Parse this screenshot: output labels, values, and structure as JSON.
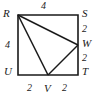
{
  "figure": {
    "type": "geometry-diagram",
    "stroke_color": "#1a1a1a",
    "background_color": "#ffffff",
    "vertices": [
      {
        "key": "R",
        "label": "R",
        "x": 18,
        "y": 15,
        "role": "square-corner-top-left"
      },
      {
        "key": "S",
        "label": "S",
        "x": 78,
        "y": 15,
        "role": "square-corner-top-right"
      },
      {
        "key": "T",
        "label": "T",
        "x": 78,
        "y": 75,
        "role": "square-corner-bottom-right"
      },
      {
        "key": "U",
        "label": "U",
        "x": 18,
        "y": 75,
        "role": "square-corner-bottom-left"
      },
      {
        "key": "W",
        "label": "W",
        "x": 78,
        "y": 45,
        "role": "midpoint-right-side"
      },
      {
        "key": "V",
        "label": "V",
        "x": 48,
        "y": 75,
        "role": "midpoint-bottom-side"
      }
    ],
    "edges": [
      {
        "from": "R",
        "to": "S",
        "part_of": "square"
      },
      {
        "from": "S",
        "to": "T",
        "part_of": "square"
      },
      {
        "from": "T",
        "to": "U",
        "part_of": "square"
      },
      {
        "from": "U",
        "to": "R",
        "part_of": "square"
      },
      {
        "from": "R",
        "to": "W",
        "part_of": "triangle"
      },
      {
        "from": "W",
        "to": "V",
        "part_of": "triangle"
      },
      {
        "from": "V",
        "to": "R",
        "part_of": "triangle"
      }
    ],
    "measurements": [
      {
        "key": "top",
        "segment": "RS",
        "value": "4",
        "side": "top"
      },
      {
        "key": "left",
        "segment": "RU",
        "value": "4",
        "side": "left"
      },
      {
        "key": "right_a",
        "segment": "SW",
        "value": "2",
        "side": "right"
      },
      {
        "key": "right_b",
        "segment": "WT",
        "value": "2",
        "side": "right"
      },
      {
        "key": "bot_a",
        "segment": "UV",
        "value": "2",
        "side": "bottom"
      },
      {
        "key": "bot_b",
        "segment": "VT",
        "value": "2",
        "side": "bottom"
      }
    ]
  }
}
